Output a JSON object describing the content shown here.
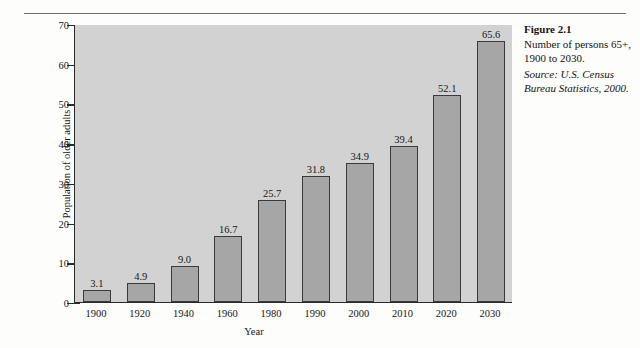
{
  "figure": {
    "caption_title": "Figure 2.1",
    "caption_body": "Number of persons 65+, 1900 to 2030.",
    "caption_source": "Source: U.S. Census Bureau Statistics, 2000."
  },
  "colors": {
    "bar_fill": "#a6a6a6",
    "bar_stroke": "#3a3a3a",
    "plot_background": "#d2d2d2",
    "axis": "#2b2b2b",
    "text": "#171717",
    "page_background": "#fdfdfc",
    "rule": "#6f6f6f"
  },
  "chart_data": {
    "type": "bar",
    "title": "",
    "xlabel": "Year",
    "ylabel": "Population of older adults (in millions)",
    "ylabel_line1": "Population of older adults",
    "ylabel_line2": "(in millions)",
    "categories": [
      "1900",
      "1920",
      "1940",
      "1960",
      "1980",
      "1990",
      "2000",
      "2010",
      "2020",
      "2030"
    ],
    "values": [
      3.1,
      4.9,
      9.0,
      16.7,
      25.7,
      31.8,
      34.9,
      39.4,
      52.1,
      65.6
    ],
    "value_labels": [
      "3.1",
      "4.9",
      "9.0",
      "16.7",
      "25.7",
      "31.8",
      "34.9",
      "39.4",
      "52.1",
      "65.6"
    ],
    "ylim": [
      0,
      70
    ],
    "ytick_values": [
      0,
      10,
      20,
      30,
      40,
      50,
      60,
      70
    ],
    "ytick_labels": [
      "0",
      "10",
      "20",
      "30",
      "40",
      "50",
      "60",
      "70"
    ],
    "grid": false,
    "legend": false,
    "legend_position": "none"
  }
}
